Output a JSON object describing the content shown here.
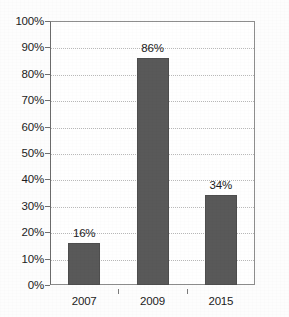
{
  "chart_data": {
    "type": "bar",
    "title": "",
    "xlabel": "",
    "ylabel": "",
    "categories": [
      "2007",
      "2009",
      "2015"
    ],
    "values": [
      16,
      86,
      34
    ],
    "value_labels": [
      "16%",
      "86%",
      "34%"
    ],
    "series": [
      {
        "name": "",
        "values": [
          16,
          86,
          34
        ]
      }
    ],
    "ylim": [
      0,
      100
    ],
    "y_ticks": [
      0,
      10,
      20,
      30,
      40,
      50,
      60,
      70,
      80,
      90,
      100
    ],
    "y_tick_labels": [
      "0%",
      "10%",
      "20%",
      "30%",
      "40%",
      "50%",
      "60%",
      "70%",
      "80%",
      "90%",
      "100%"
    ],
    "grid": true,
    "grid_axis": "y",
    "legend": false,
    "legend_position": "none",
    "bar_color": "#595959",
    "grid_color": "#b9b9b9",
    "axis_color": "#8e8e8e",
    "background_color": "#ffffff",
    "text_color": "#1c1c1c",
    "data_labels_shown": true
  }
}
